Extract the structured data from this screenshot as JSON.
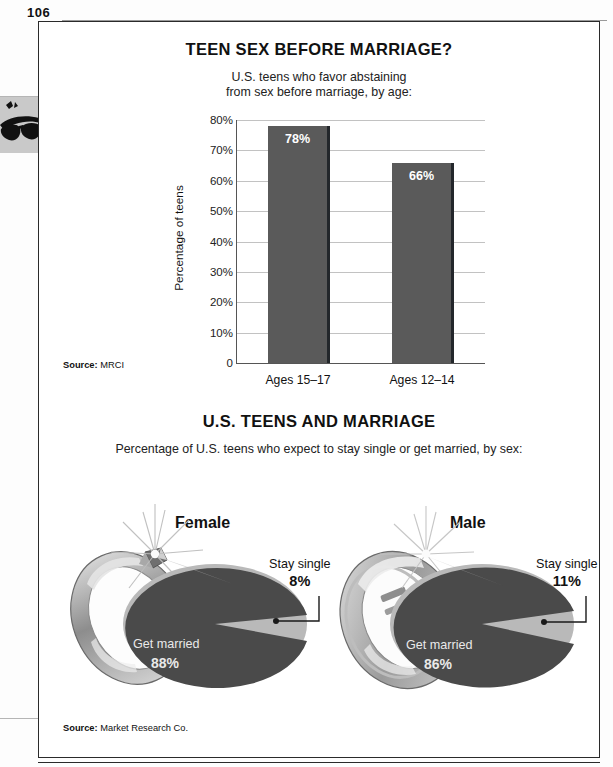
{
  "page": {
    "number": "106",
    "margin_icon": "sunglasses-icon"
  },
  "chart1": {
    "title": "TEEN SEX BEFORE MARRIAGE?",
    "subtitle_line1": "U.S. teens who favor abstaining",
    "subtitle_line2": "from sex before marriage, by age:",
    "source_label": "Source:",
    "source_value": "MRCI"
  },
  "chart2": {
    "title": "U.S. TEENS AND MARRIAGE",
    "subtitle": "Percentage of U.S. teens who expect to stay single or get married, by sex:",
    "source_label": "Source:",
    "source_value": "Market Research Co.",
    "female": {
      "heading": "Female",
      "married_label": "Get married",
      "married_pct": "88%",
      "single_label": "Stay single",
      "single_pct": "8%"
    },
    "male": {
      "heading": "Male",
      "married_label": "Get married",
      "married_pct": "86%",
      "single_label": "Stay single",
      "single_pct": "11%"
    }
  },
  "chart_data": [
    {
      "type": "bar",
      "title": "TEEN SEX BEFORE MARRIAGE?",
      "subtitle": "U.S. teens who favor abstaining from sex before marriage, by age:",
      "categories": [
        "Ages 15–17",
        "Ages 12–14"
      ],
      "values": [
        78,
        66
      ],
      "value_labels": [
        "78%",
        "66%"
      ],
      "xlabel": "",
      "ylabel": "Percentage of teens",
      "ylim": [
        0,
        80
      ],
      "yticks": [
        0,
        10,
        20,
        30,
        40,
        50,
        60,
        70,
        80
      ],
      "ytick_labels": [
        "0",
        "10%",
        "20%",
        "30%",
        "40%",
        "50%",
        "60%",
        "70%",
        "80%"
      ],
      "grid": true,
      "legend": "none",
      "bar_color": "#5a5a5a",
      "source": "Source: MRCI"
    },
    {
      "type": "pie",
      "title": "U.S. TEENS AND MARRIAGE — Female",
      "labels": [
        "Get married",
        "Stay single"
      ],
      "values": [
        88,
        8
      ],
      "value_labels": [
        "88%",
        "8%"
      ],
      "colors": [
        "#4a4a4a",
        "#b9b9b9"
      ],
      "legend": "callout",
      "source": "Source: Market Research Co."
    },
    {
      "type": "pie",
      "title": "U.S. TEENS AND MARRIAGE — Male",
      "labels": [
        "Get married",
        "Stay single"
      ],
      "values": [
        86,
        11
      ],
      "value_labels": [
        "86%",
        "11%"
      ],
      "colors": [
        "#4a4a4a",
        "#b9b9b9"
      ],
      "legend": "callout",
      "source": "Source: Market Research Co."
    }
  ]
}
